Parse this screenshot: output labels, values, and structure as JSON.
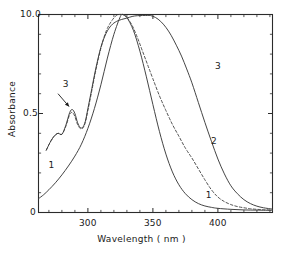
{
  "chart_data": {
    "type": "line",
    "title": "",
    "xlabel": "Wavelength ( nm )",
    "ylabel": "Absorbance",
    "xlim": [
      262,
      442
    ],
    "ylim": [
      0,
      1.0
    ],
    "xticks": [
      300,
      350,
      400
    ],
    "xtick_labels": [
      "300",
      "350",
      "400"
    ],
    "xminor_spacing": 10,
    "yticks": [
      0,
      0.5,
      1.0
    ],
    "ytick_labels": [
      "0",
      "0.5",
      "10.0"
    ],
    "grid": false,
    "legend": "inline-curve-labels",
    "annotations": [
      {
        "text": "3",
        "x": 283,
        "y": 0.645,
        "note": "label with arrow pointing to shoulder of curve 3"
      },
      {
        "text": "1",
        "x": 272,
        "y": 0.235,
        "note": "label for curve 1 rising edge"
      },
      {
        "text": "3",
        "x": 400,
        "y": 0.735,
        "note": "label on descending side of curve 3"
      },
      {
        "text": "2",
        "x": 397,
        "y": 0.355,
        "note": "label on descending side of curve 2"
      },
      {
        "text": "1",
        "x": 393,
        "y": 0.085,
        "note": "label on descending tail of curve 1"
      }
    ],
    "series": [
      {
        "name": "1",
        "style": "solid",
        "color": "#3a3a3a",
        "peak_x": 327,
        "peak_y": 1.0,
        "x": [
          262,
          266,
          270,
          275,
          280,
          285,
          290,
          295,
          300,
          305,
          310,
          315,
          320,
          325,
          327,
          330,
          335,
          340,
          345,
          350,
          355,
          360,
          365,
          370,
          375,
          380,
          385,
          390,
          395,
          400,
          410,
          420,
          430,
          442
        ],
        "y": [
          0.07,
          0.09,
          0.115,
          0.15,
          0.19,
          0.235,
          0.285,
          0.345,
          0.425,
          0.525,
          0.645,
          0.78,
          0.9,
          0.99,
          1.0,
          0.985,
          0.92,
          0.815,
          0.685,
          0.545,
          0.41,
          0.295,
          0.205,
          0.14,
          0.095,
          0.065,
          0.045,
          0.033,
          0.026,
          0.021,
          0.016,
          0.013,
          0.012,
          0.011
        ]
      },
      {
        "name": "2",
        "style": "dashed",
        "color": "#4a4a4a",
        "peak_x": 326,
        "peak_y": 1.0,
        "shoulder_x": 287,
        "shoulder_y": 0.505,
        "x": [
          268,
          271,
          274,
          277,
          280,
          283,
          286,
          288,
          290,
          292,
          294,
          296,
          298,
          300,
          303,
          306,
          310,
          314,
          318,
          322,
          326,
          330,
          334,
          338,
          342,
          346,
          350,
          355,
          360,
          365,
          370,
          375,
          380,
          385,
          390,
          395,
          400,
          405,
          410,
          415,
          420,
          425,
          430,
          435,
          442
        ],
        "y": [
          0.315,
          0.355,
          0.385,
          0.4,
          0.395,
          0.435,
          0.495,
          0.505,
          0.485,
          0.445,
          0.425,
          0.425,
          0.455,
          0.515,
          0.615,
          0.715,
          0.83,
          0.915,
          0.965,
          0.995,
          1.0,
          0.985,
          0.945,
          0.885,
          0.815,
          0.745,
          0.675,
          0.59,
          0.515,
          0.445,
          0.385,
          0.325,
          0.275,
          0.22,
          0.165,
          0.115,
          0.078,
          0.055,
          0.04,
          0.03,
          0.024,
          0.019,
          0.016,
          0.014,
          0.012
        ]
      },
      {
        "name": "3",
        "style": "solid",
        "color": "#3a3a3a",
        "peak_x": 348,
        "peak_y": 0.995,
        "shoulder_x": 287,
        "shoulder_y": 0.52,
        "x": [
          268,
          271,
          274,
          277,
          280,
          283,
          286,
          288,
          290,
          292,
          294,
          296,
          298,
          300,
          303,
          306,
          310,
          314,
          318,
          322,
          326,
          330,
          334,
          338,
          342,
          346,
          348,
          352,
          356,
          360,
          364,
          368,
          372,
          376,
          380,
          385,
          390,
          395,
          400,
          405,
          410,
          415,
          420,
          425,
          430,
          435,
          442
        ],
        "y": [
          0.315,
          0.355,
          0.385,
          0.4,
          0.395,
          0.44,
          0.505,
          0.52,
          0.5,
          0.455,
          0.43,
          0.43,
          0.46,
          0.525,
          0.625,
          0.725,
          0.835,
          0.905,
          0.945,
          0.965,
          0.975,
          0.982,
          0.99,
          0.994,
          0.995,
          0.995,
          0.995,
          0.985,
          0.965,
          0.935,
          0.895,
          0.845,
          0.79,
          0.725,
          0.655,
          0.555,
          0.455,
          0.36,
          0.27,
          0.195,
          0.135,
          0.095,
          0.065,
          0.045,
          0.032,
          0.024,
          0.017
        ]
      }
    ]
  },
  "axis": {
    "y_top_label": "10.0",
    "y_mid_label": "0.5",
    "y_zero_label": "0",
    "x_label_300": "300",
    "x_label_350": "350",
    "x_label_400": "400",
    "x_title": "Wavelength ( nm )",
    "y_title": "Absorbance"
  },
  "curve_labels": {
    "shoulder_three": "3",
    "left_one": "1",
    "right_three": "3",
    "right_two": "2",
    "right_one": "1"
  }
}
